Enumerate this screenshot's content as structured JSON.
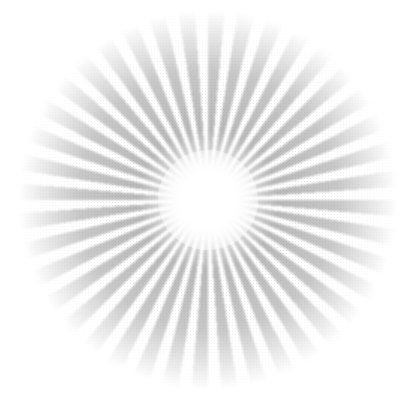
{
  "image": {
    "subject": "grainy gray starburst with white glowing center",
    "colors": {
      "background": "#ffffff",
      "ray": "#b0b0b0",
      "center": "#ffffff"
    }
  }
}
